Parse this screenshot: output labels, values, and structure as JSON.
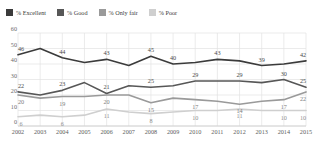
{
  "legend": {
    "items": [
      {
        "label": "% Excellent",
        "color": "#3b3b3b",
        "icon": "square-swatch"
      },
      {
        "label": "% Good",
        "color": "#575757",
        "icon": "square-swatch"
      },
      {
        "label": "% Only fair",
        "color": "#9a9a9a",
        "icon": "square-swatch"
      },
      {
        "label": "% Poor",
        "color": "#cfcfcf",
        "icon": "square-swatch"
      }
    ]
  },
  "chart_data": {
    "type": "line",
    "title": "",
    "xlabel": "",
    "ylabel": "",
    "ylim": [
      0,
      60
    ],
    "yticks": [
      0,
      10,
      20,
      30,
      40,
      50,
      60
    ],
    "grid": true,
    "legend_position": "top-left",
    "categories": [
      "2002",
      "2003",
      "2004",
      "2005",
      "2006",
      "2007",
      "2008",
      "2009",
      "2010",
      "2011",
      "2012",
      "2013",
      "2014",
      "2015"
    ],
    "series": [
      {
        "name": "% Excellent",
        "color": "#3b3b3b",
        "values": [
          46,
          50,
          44,
          41,
          43,
          39,
          45,
          40,
          41,
          43,
          42,
          39,
          40,
          42
        ],
        "point_labels": [
          "46",
          "",
          "44",
          "",
          "43",
          "",
          "45",
          "40",
          "",
          "43",
          "",
          "39",
          "",
          "42"
        ]
      },
      {
        "name": "% Good",
        "color": "#575757",
        "values": [
          22,
          20,
          23,
          28,
          21,
          26,
          25,
          26,
          29,
          29,
          29,
          28,
          30,
          25
        ],
        "point_labels": [
          "22",
          "",
          "23",
          "",
          "21",
          "",
          "25",
          "",
          "29",
          "",
          "29",
          "",
          "30",
          "25"
        ]
      },
      {
        "name": "% Only fair",
        "color": "#9a9a9a",
        "values": [
          20,
          18,
          19,
          19,
          20,
          20,
          15,
          18,
          17,
          16,
          14,
          16,
          17,
          22
        ],
        "point_labels": [
          "20",
          "",
          "19",
          "",
          "20",
          "",
          "15",
          "",
          "17",
          "",
          "14",
          "",
          "17",
          "22"
        ]
      },
      {
        "name": "% Poor",
        "color": "#cfcfcf",
        "values": [
          6,
          7,
          6,
          7,
          11,
          9,
          8,
          9,
          10,
          10,
          11,
          10,
          10,
          10
        ],
        "point_labels": [
          "6",
          "",
          "6",
          "",
          "11",
          "",
          "8",
          "",
          "10",
          "",
          "11",
          "",
          "10",
          "10"
        ]
      }
    ]
  }
}
